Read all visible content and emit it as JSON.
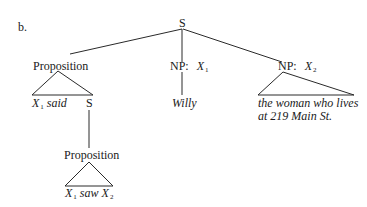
{
  "diagram": {
    "label": "b.",
    "root": {
      "label": "S"
    },
    "branches": [
      {
        "label": "Proposition",
        "type": "triangle",
        "leaves": [
          {
            "var": "X",
            "sub": "1",
            "text": " said"
          },
          {
            "label": "S"
          }
        ],
        "child": {
          "label": "Proposition",
          "type": "triangle",
          "leaf": {
            "var1": "X",
            "sub1": "1",
            "mid": " saw ",
            "var2": "X",
            "sub2": "2"
          }
        }
      },
      {
        "label": "NP:",
        "var": "X",
        "sub": "1",
        "type": "line",
        "leaf": "Willy"
      },
      {
        "label": "NP:",
        "var": "X",
        "sub": "2",
        "type": "triangle",
        "leaf_lines": [
          "the woman who lives",
          "at 219 Main St."
        ]
      }
    ]
  }
}
